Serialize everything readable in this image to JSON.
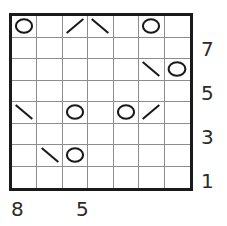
{
  "puzzle": {
    "title": "Circles and Lines Grid Puzzle",
    "grid": {
      "columns": 7,
      "rows": 8,
      "border_color": "#1a1a1a",
      "gridline_color": "#8d8d8d",
      "background_color": "#ffffff",
      "mark_color": "#1a1a1a"
    },
    "cells": [
      [
        {
          "mark": "circle"
        },
        {
          "mark": "empty"
        },
        {
          "mark": "slash"
        },
        {
          "mark": "backslash"
        },
        {
          "mark": "empty"
        },
        {
          "mark": "circle"
        },
        {
          "mark": "empty"
        }
      ],
      [
        {
          "mark": "empty"
        },
        {
          "mark": "empty"
        },
        {
          "mark": "empty"
        },
        {
          "mark": "empty"
        },
        {
          "mark": "empty"
        },
        {
          "mark": "empty"
        },
        {
          "mark": "empty"
        }
      ],
      [
        {
          "mark": "empty"
        },
        {
          "mark": "empty"
        },
        {
          "mark": "empty"
        },
        {
          "mark": "empty"
        },
        {
          "mark": "empty"
        },
        {
          "mark": "backslash"
        },
        {
          "mark": "circle"
        }
      ],
      [
        {
          "mark": "empty"
        },
        {
          "mark": "empty"
        },
        {
          "mark": "empty"
        },
        {
          "mark": "empty"
        },
        {
          "mark": "empty"
        },
        {
          "mark": "empty"
        },
        {
          "mark": "empty"
        }
      ],
      [
        {
          "mark": "backslash"
        },
        {
          "mark": "empty"
        },
        {
          "mark": "circle"
        },
        {
          "mark": "empty"
        },
        {
          "mark": "circle"
        },
        {
          "mark": "slash"
        },
        {
          "mark": "empty"
        }
      ],
      [
        {
          "mark": "empty"
        },
        {
          "mark": "empty"
        },
        {
          "mark": "empty"
        },
        {
          "mark": "empty"
        },
        {
          "mark": "empty"
        },
        {
          "mark": "empty"
        },
        {
          "mark": "empty"
        }
      ],
      [
        {
          "mark": "empty"
        },
        {
          "mark": "backslash"
        },
        {
          "mark": "circle"
        },
        {
          "mark": "empty"
        },
        {
          "mark": "empty"
        },
        {
          "mark": "empty"
        },
        {
          "mark": "empty"
        }
      ],
      [
        {
          "mark": "empty"
        },
        {
          "mark": "empty"
        },
        {
          "mark": "empty"
        },
        {
          "mark": "empty"
        },
        {
          "mark": "empty"
        },
        {
          "mark": "empty"
        },
        {
          "mark": "empty"
        }
      ]
    ],
    "right_clues": [
      {
        "label": "7",
        "top": 39
      },
      {
        "label": "5",
        "top": 83
      },
      {
        "label": "3",
        "top": 127
      },
      {
        "label": "1",
        "top": 171
      }
    ],
    "bottom_clues": [
      {
        "label": "8",
        "left": 11
      },
      {
        "label": "5",
        "left": 76
      }
    ]
  }
}
